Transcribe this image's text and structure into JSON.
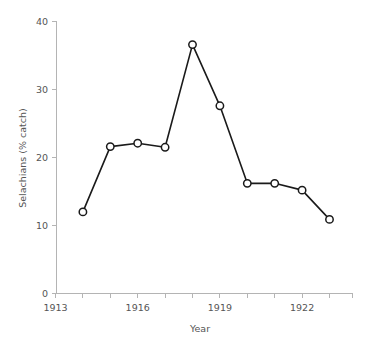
{
  "chart_data": {
    "type": "line",
    "title": "",
    "subtitle": "",
    "xlabel": "Year",
    "ylabel": "Selachians (% catch)",
    "x": [
      1914,
      1915,
      1916,
      1917,
      1918,
      1919,
      1920,
      1921,
      1922,
      1923
    ],
    "values": [
      12.0,
      21.6,
      22.1,
      21.5,
      36.6,
      27.6,
      16.2,
      16.2,
      15.2,
      10.9
    ],
    "series": [
      {
        "name": "Selachians (% catch)",
        "values": [
          12.0,
          21.6,
          22.1,
          21.5,
          36.6,
          27.6,
          16.2,
          16.2,
          15.2,
          10.9
        ]
      }
    ],
    "xlim": [
      1913,
      1924
    ],
    "ylim": [
      0,
      40
    ],
    "ytick_labels": [
      "40",
      "30",
      "20",
      "10",
      "0"
    ],
    "ytick_values": [
      40,
      30,
      20,
      10,
      0
    ],
    "xtick_labels": [
      "1913",
      "1916",
      "1919",
      "1922"
    ],
    "xtick_values": [
      1913,
      1916,
      1919,
      1922
    ],
    "xminor_ticks": [
      1913,
      1914,
      1915,
      1916,
      1917,
      1918,
      1919,
      1920,
      1921,
      1922,
      1923,
      1924
    ],
    "grid": false,
    "legend": false,
    "legend_position": "none",
    "marker": "open-circle",
    "line_color": "#1a1a1a",
    "marker_fill": "#ffffff",
    "axis_color": "#b4b4b4",
    "text_color": "#555555",
    "background": "#ffffff",
    "annotations": []
  }
}
